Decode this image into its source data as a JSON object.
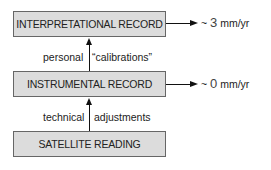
{
  "boxes": {
    "interpretational": "INTERPRETATIONAL RECORD",
    "instrumental": "INSTRUMENTAL RECORD",
    "satellite": "SATELLITE READING"
  },
  "rates": {
    "interpretational": {
      "prefix": "~ ",
      "value": "3",
      "unit": " mm/yr"
    },
    "instrumental": {
      "prefix": "~ ",
      "value": "0",
      "unit": " mm/yr"
    }
  },
  "edges": {
    "upper": {
      "left": "personal",
      "right": "“calibrations”"
    },
    "lower": {
      "left": "technical",
      "right": "adjustments"
    }
  },
  "colors": {
    "box_fill": "#dcdcdc",
    "box_border": "#666666",
    "line": "#111111"
  }
}
